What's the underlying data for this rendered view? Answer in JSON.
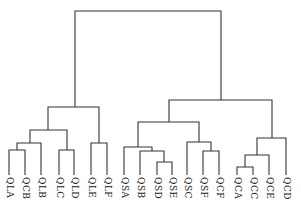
{
  "diagram": {
    "type": "dendrogram",
    "line_color": "#333333",
    "background": "#ffffff",
    "leaves": [
      {
        "label": "QLA",
        "x": 9
      },
      {
        "label": "QCB",
        "x": 25
      },
      {
        "label": "QLB",
        "x": 41
      },
      {
        "label": "QLC",
        "x": 59
      },
      {
        "label": "QLD",
        "x": 74
      },
      {
        "label": "QLE",
        "x": 91
      },
      {
        "label": "QLF",
        "x": 107
      },
      {
        "label": "QSA",
        "x": 124
      },
      {
        "label": "QSB",
        "x": 140
      },
      {
        "label": "QSD",
        "x": 157
      },
      {
        "label": "QSE",
        "x": 172
      },
      {
        "label": "QSC",
        "x": 187
      },
      {
        "label": "QSF",
        "x": 203
      },
      {
        "label": "QCF",
        "x": 219
      },
      {
        "label": "QCA",
        "x": 237
      },
      {
        "label": "QCC",
        "x": 253
      },
      {
        "label": "QCE",
        "x": 269
      },
      {
        "label": "QCD",
        "x": 286
      }
    ],
    "leaf_bottom_y": 175,
    "merges": [
      {
        "lx": 9,
        "ly": 175,
        "rx": 25,
        "ry": 175,
        "y": 150,
        "mx": 17
      },
      {
        "lx": 17,
        "ly": 150,
        "rx": 41,
        "ry": 175,
        "y": 143,
        "mx": 30
      },
      {
        "lx": 59,
        "ly": 175,
        "rx": 74,
        "ry": 175,
        "y": 150,
        "mx": 67
      },
      {
        "lx": 30,
        "ly": 143,
        "rx": 67,
        "ry": 150,
        "y": 130,
        "mx": 48
      },
      {
        "lx": 91,
        "ly": 175,
        "rx": 107,
        "ry": 175,
        "y": 143,
        "mx": 99
      },
      {
        "lx": 48,
        "ly": 130,
        "rx": 99,
        "ry": 143,
        "y": 107,
        "mx": 75
      },
      {
        "lx": 157,
        "ly": 175,
        "rx": 172,
        "ry": 175,
        "y": 162,
        "mx": 164
      },
      {
        "lx": 140,
        "ly": 175,
        "rx": 164,
        "ry": 162,
        "y": 151,
        "mx": 152
      },
      {
        "lx": 124,
        "ly": 175,
        "rx": 152,
        "ry": 151,
        "y": 147,
        "mx": 138
      },
      {
        "lx": 203,
        "ly": 175,
        "rx": 219,
        "ry": 175,
        "y": 151,
        "mx": 211
      },
      {
        "lx": 187,
        "ly": 175,
        "rx": 211,
        "ry": 151,
        "y": 142,
        "mx": 199
      },
      {
        "lx": 138,
        "ly": 147,
        "rx": 199,
        "ry": 142,
        "y": 122,
        "mx": 169
      },
      {
        "lx": 237,
        "ly": 175,
        "rx": 253,
        "ry": 175,
        "y": 167,
        "mx": 245
      },
      {
        "lx": 245,
        "ly": 167,
        "rx": 269,
        "ry": 175,
        "y": 155,
        "mx": 257
      },
      {
        "lx": 257,
        "ly": 155,
        "rx": 286,
        "ry": 175,
        "y": 138,
        "mx": 272
      },
      {
        "lx": 169,
        "ly": 122,
        "rx": 272,
        "ry": 138,
        "y": 100,
        "mx": 221
      },
      {
        "lx": 75,
        "ly": 107,
        "rx": 221,
        "ry": 100,
        "y": 11,
        "mx": 148
      }
    ]
  }
}
